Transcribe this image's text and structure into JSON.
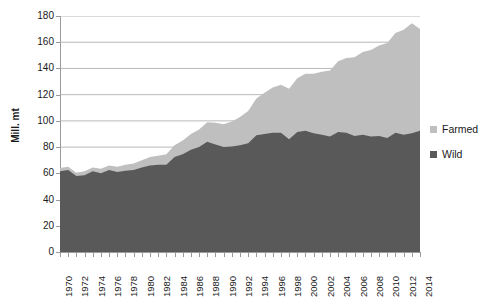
{
  "chart_data": {
    "type": "area",
    "stacked": true,
    "title": "",
    "xlabel": "",
    "ylabel": "Mill. mt",
    "ylim": [
      0,
      180
    ],
    "ytick_step": 20,
    "yticks": [
      0,
      20,
      40,
      60,
      80,
      100,
      120,
      140,
      160,
      180
    ],
    "grid": "horizontal",
    "legend_position": "right",
    "x": [
      1970,
      1971,
      1972,
      1973,
      1974,
      1975,
      1976,
      1977,
      1978,
      1979,
      1980,
      1981,
      1982,
      1983,
      1984,
      1985,
      1986,
      1987,
      1988,
      1989,
      1990,
      1991,
      1992,
      1993,
      1994,
      1995,
      1996,
      1997,
      1998,
      1999,
      2000,
      2001,
      2002,
      2003,
      2004,
      2005,
      2006,
      2007,
      2008,
      2009,
      2010,
      2011,
      2012,
      2013,
      2014
    ],
    "xtick_labels": [
      "1970",
      "1972",
      "1974",
      "1976",
      "1978",
      "1980",
      "1982",
      "1984",
      "1986",
      "1988",
      "1990",
      "1992",
      "1994",
      "1996",
      "1998",
      "2000",
      "2002",
      "2004",
      "2006",
      "2008",
      "2010",
      "2012",
      "2014"
    ],
    "series": [
      {
        "name": "Wild",
        "color": "#595959",
        "values": [
          61.5,
          62.5,
          58.0,
          58.5,
          61.5,
          60.0,
          62.5,
          61.0,
          62.0,
          62.5,
          64.5,
          66.0,
          66.5,
          66.5,
          72.5,
          74.5,
          78.0,
          80.0,
          84.0,
          82.0,
          80.0,
          80.5,
          81.5,
          83.0,
          89.0,
          90.0,
          91.0,
          91.0,
          86.0,
          91.5,
          92.5,
          90.5,
          89.5,
          88.0,
          91.5,
          91.0,
          88.5,
          89.5,
          88.0,
          88.5,
          87.0,
          91.0,
          89.5,
          90.5,
          92.5
        ]
      },
      {
        "name": "Farmed",
        "color": "#bfbfbf",
        "values": [
          2.5,
          2.5,
          2.5,
          3.0,
          3.0,
          3.5,
          3.5,
          4.0,
          4.5,
          5.0,
          5.5,
          6.5,
          7.0,
          8.0,
          9.0,
          10.5,
          12.0,
          13.5,
          15.0,
          16.5,
          17.5,
          19.0,
          21.5,
          24.5,
          28.0,
          31.5,
          34.5,
          36.5,
          38.5,
          41.0,
          43.5,
          45.5,
          48.0,
          50.5,
          54.0,
          57.0,
          60.0,
          63.0,
          66.0,
          69.0,
          72.5,
          76.0,
          80.0,
          84.0,
          77.5
        ]
      }
    ],
    "totals_note": "Stacked total reaches approximately 170 Mill. mt in 2014"
  },
  "axis": {
    "y_title": "Mill. mt"
  },
  "legend": {
    "items": [
      {
        "label": "Farmed",
        "color": "#bfbfbf"
      },
      {
        "label": "Wild",
        "color": "#595959"
      }
    ]
  }
}
